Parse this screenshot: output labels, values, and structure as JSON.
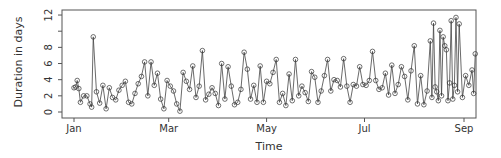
{
  "chart_data": {
    "type": "line",
    "title": "",
    "xlabel": "Time",
    "ylabel": "Duration in days",
    "x_ticks": [
      "Jan",
      "Mar",
      "May",
      "Jul",
      "Sep"
    ],
    "x_tick_days": [
      0,
      59,
      120,
      181,
      243
    ],
    "y_ticks": [
      0,
      2,
      4,
      6,
      8,
      12
    ],
    "y_minor_ticks": [
      10
    ],
    "ylim": [
      0,
      12.2
    ],
    "grid": false,
    "legend": null,
    "marker": "open-circle",
    "series": [
      {
        "name": "duration",
        "x_day": [
          0,
          1,
          2,
          3,
          4,
          6,
          8,
          10,
          11,
          12,
          14,
          16,
          18,
          20,
          22,
          24,
          26,
          28,
          30,
          32,
          34,
          36,
          38,
          40,
          42,
          44,
          46,
          48,
          50,
          52,
          54,
          56,
          58,
          60,
          62,
          64,
          66,
          68,
          70,
          72,
          74,
          76,
          78,
          80,
          82,
          84,
          86,
          88,
          90,
          92,
          94,
          96,
          98,
          100,
          102,
          104,
          106,
          108,
          110,
          112,
          114,
          116,
          118,
          120,
          122,
          124,
          126,
          128,
          130,
          132,
          134,
          136,
          138,
          140,
          142,
          144,
          146,
          148,
          150,
          152,
          154,
          156,
          158,
          160,
          162,
          164,
          166,
          168,
          170,
          172,
          174,
          176,
          178,
          180,
          182,
          184,
          186,
          188,
          190,
          192,
          194,
          196,
          198,
          200,
          202,
          204,
          206,
          208,
          210,
          212,
          214,
          216,
          218,
          220,
          222,
          223,
          224,
          225,
          226,
          227,
          228,
          229,
          230,
          231,
          232,
          233,
          234,
          235,
          236,
          237,
          238,
          239,
          240,
          242,
          244,
          246,
          248,
          249,
          250
        ],
        "values": [
          3.0,
          3.1,
          3.9,
          2.9,
          1.2,
          2.0,
          2.0,
          1.0,
          0.6,
          9.3,
          2.5,
          1.1,
          3.3,
          0.4,
          3.0,
          1.8,
          1.5,
          2.7,
          3.3,
          3.8,
          1.2,
          1.0,
          2.3,
          3.5,
          4.4,
          6.2,
          2.0,
          6.2,
          3.3,
          4.8,
          1.6,
          0.4,
          3.9,
          3.2,
          2.6,
          1.0,
          0.1,
          4.9,
          3.8,
          2.8,
          5.7,
          1.8,
          3.2,
          7.6,
          1.5,
          2.2,
          3.0,
          2.3,
          0.8,
          6.0,
          1.6,
          5.6,
          3.2,
          0.9,
          1.2,
          2.8,
          7.4,
          5.3,
          1.6,
          3.3,
          1.2,
          5.7,
          1.2,
          3.8,
          3.5,
          4.9,
          6.5,
          1.2,
          2.3,
          0.8,
          4.7,
          1.4,
          6.5,
          2.0,
          3.2,
          2.4,
          1.3,
          5.0,
          4.3,
          1.2,
          2.6,
          4.5,
          6.5,
          2.6,
          4.0,
          3.9,
          3.1,
          6.6,
          3.2,
          1.2,
          3.4,
          3.2,
          5.6,
          3.4,
          3.3,
          3.9,
          7.5,
          3.9,
          2.8,
          3.0,
          4.8,
          2.1,
          5.8,
          2.3,
          3.4,
          5.6,
          4.4,
          1.5,
          5.1,
          8.2,
          1.0,
          4.5,
          0.9,
          2.6,
          8.8,
          1.8,
          11.0,
          3.1,
          2.5,
          1.4,
          10.1,
          2.0,
          9.3,
          8.2,
          7.7,
          1.4,
          3.6,
          11.3,
          1.6,
          3.3,
          11.7,
          2.5,
          10.9,
          1.8,
          4.5,
          3.3,
          5.2,
          2.3,
          7.2,
          3.0,
          1.5,
          1.1,
          6.8
        ]
      }
    ]
  },
  "axes": {
    "xlabel": "Time",
    "ylabel": "Duration in days"
  }
}
